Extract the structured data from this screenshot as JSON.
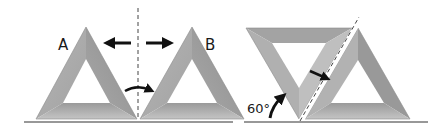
{
  "diagram": {
    "labels": {
      "a": "A",
      "b": "B",
      "angle": "60°"
    },
    "colors": {
      "face_light": "#bdbdbd",
      "face_mid": "#a6a6a6",
      "face_dark": "#8f8f8f",
      "line": "#333333",
      "arrow": "#111111"
    },
    "elements": [
      {
        "name": "triangle-a",
        "type": "triangular-frame",
        "orientation": "upright"
      },
      {
        "name": "triangle-b",
        "type": "triangular-frame",
        "orientation": "upright"
      },
      {
        "name": "mirror-line-vertical",
        "type": "dashed-line"
      },
      {
        "name": "arrow-left",
        "type": "arrow"
      },
      {
        "name": "arrow-right",
        "type": "arrow"
      },
      {
        "name": "curved-arrow-rotate",
        "type": "arrow"
      },
      {
        "name": "triangle-inverted",
        "type": "triangular-frame",
        "orientation": "inverted"
      },
      {
        "name": "triangle-upright-right",
        "type": "triangular-frame",
        "orientation": "upright"
      },
      {
        "name": "mirror-line-slanted",
        "type": "dashed-line",
        "angle_deg": 60
      },
      {
        "name": "arrow-toward-line",
        "type": "arrow"
      },
      {
        "name": "angle-arrow",
        "type": "arrow"
      }
    ]
  }
}
